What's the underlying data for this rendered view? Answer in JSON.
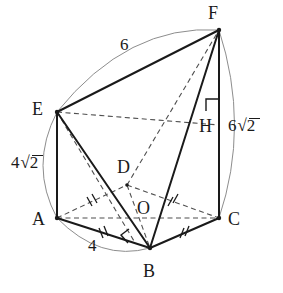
{
  "figure": {
    "kind": "geometry-diagram",
    "stroke_color": "#1a1a1a",
    "arc_color": "#8a8a8a",
    "dash_color": "#4d4d4d"
  },
  "vertices": [
    {
      "id": "A",
      "label": "A",
      "x": 57,
      "y": 218,
      "label_x": 38,
      "label_y": 218
    },
    {
      "id": "B",
      "label": "B",
      "x": 150,
      "y": 248,
      "label_x": 146,
      "label_y": 270
    },
    {
      "id": "C",
      "label": "C",
      "x": 219,
      "y": 218,
      "label_x": 231,
      "label_y": 218
    },
    {
      "id": "D",
      "label": "D",
      "x": 127,
      "y": 185,
      "label_x": 119,
      "label_y": 166
    },
    {
      "id": "E",
      "label": "E",
      "x": 57,
      "y": 112,
      "label_x": 38,
      "label_y": 110
    },
    {
      "id": "F",
      "label": "F",
      "x": 219,
      "y": 30,
      "label_x": 214,
      "label_y": 13
    },
    {
      "id": "H",
      "label": "H",
      "x": 219,
      "y": 125,
      "label_x": 203,
      "label_y": 127
    },
    {
      "id": "O",
      "label": "O",
      "x": 143,
      "y": 216,
      "label_x": 140,
      "label_y": 208
    }
  ],
  "measurements": [
    {
      "id": "ef",
      "text": "6",
      "number": "6",
      "radical": null,
      "x": 120,
      "y": 38,
      "edge": "EF"
    },
    {
      "id": "fc",
      "text": "6√2",
      "number": "6",
      "radical": "2",
      "x": 230,
      "y": 118,
      "edge": "FC"
    },
    {
      "id": "ea",
      "text": "4√2",
      "number": "4",
      "radical": "2",
      "x": 12,
      "y": 155,
      "edge": "EA"
    },
    {
      "id": "ab",
      "text": "4",
      "number": "4",
      "radical": null,
      "x": 89,
      "y": 238,
      "edge": "AB"
    }
  ],
  "edges_solid": [
    {
      "from": "E",
      "to": "F",
      "name": "edge-EF"
    },
    {
      "from": "E",
      "to": "A",
      "name": "edge-EA"
    },
    {
      "from": "A",
      "to": "B",
      "name": "edge-AB"
    },
    {
      "from": "B",
      "to": "C",
      "name": "edge-BC"
    },
    {
      "from": "C",
      "to": "F",
      "name": "edge-CF"
    },
    {
      "from": "E",
      "to": "B",
      "name": "edge-EB"
    },
    {
      "from": "B",
      "to": "F",
      "name": "edge-BF"
    }
  ],
  "edges_dashed": [
    {
      "from": "E",
      "to": "H",
      "name": "edge-EH"
    },
    {
      "from": "A",
      "to": "C",
      "name": "edge-AC"
    },
    {
      "from": "A",
      "to": "D",
      "name": "edge-AD"
    },
    {
      "from": "D",
      "to": "C",
      "name": "edge-DC"
    },
    {
      "from": "D",
      "to": "B",
      "name": "edge-DB"
    },
    {
      "from": "D",
      "to": "F",
      "name": "edge-DF"
    },
    {
      "from": "E",
      "to": "D",
      "name": "edge-ED"
    },
    {
      "from": "D",
      "to": "E",
      "name": "edge-DE-lower"
    }
  ],
  "tick_marks": [
    {
      "edge": "AD",
      "count": 2,
      "name": "tick-AD"
    },
    {
      "edge": "DC",
      "count": 2,
      "name": "tick-DC"
    },
    {
      "edge": "AB",
      "count": 2,
      "name": "tick-AB"
    },
    {
      "edge": "BC",
      "count": 2,
      "name": "tick-BC"
    }
  ],
  "right_angles": [
    {
      "at": "H",
      "name": "right-angle-H"
    },
    {
      "at": "B",
      "name": "right-angle-B"
    }
  ],
  "arcs": [
    {
      "name": "arc-EF",
      "from": "E",
      "to": "F"
    },
    {
      "name": "arc-FC",
      "from": "F",
      "to": "C"
    },
    {
      "name": "arc-EA",
      "from": "E",
      "to": "A"
    },
    {
      "name": "arc-AB",
      "from": "A",
      "to": "B"
    }
  ]
}
